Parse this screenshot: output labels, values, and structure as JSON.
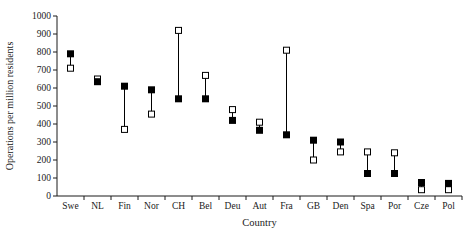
{
  "chart_data": {
    "type": "scatter",
    "title": "",
    "xlabel": "Country",
    "ylabel": "Operations per million residents",
    "ylim": [
      0,
      1000
    ],
    "ytick_step": 100,
    "grid": false,
    "legend_position": "none",
    "background_color": "#ffffff",
    "axis_color": "#1a1a1a",
    "categories": [
      "Swe",
      "NL",
      "Fin",
      "Nor",
      "CH",
      "Bel",
      "Deu",
      "Aut",
      "Fra",
      "GB",
      "Den",
      "Spa",
      "Por",
      "Cze",
      "Pol"
    ],
    "series": [
      {
        "name": "filled-square",
        "marker": "filled-square",
        "color": "#000000",
        "values": [
          790,
          635,
          610,
          590,
          540,
          540,
          420,
          365,
          340,
          310,
          300,
          125,
          125,
          75,
          70
        ]
      },
      {
        "name": "open-square",
        "marker": "open-square",
        "color": "#000000",
        "fill_color": "#ffffff",
        "values": [
          710,
          650,
          370,
          455,
          920,
          670,
          480,
          410,
          810,
          200,
          245,
          245,
          240,
          35,
          35
        ]
      }
    ],
    "connectors": true
  }
}
